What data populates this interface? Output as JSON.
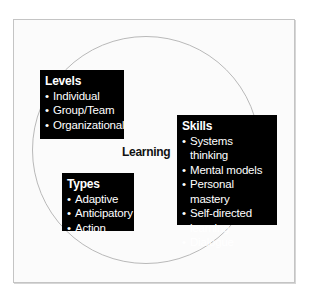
{
  "diagram": {
    "center_label": "Learning",
    "boxes": [
      {
        "title": "Levels",
        "items": [
          "Individual",
          "Group/Team",
          "Organizational"
        ]
      },
      {
        "title": "Skills",
        "items": [
          "Systems thinking",
          "Mental models",
          "Personal mastery",
          "Self-directed",
          "learning",
          "Dialogue"
        ]
      },
      {
        "title": "Types",
        "items": [
          "Adaptive",
          "Anticipatory",
          "Action"
        ]
      }
    ],
    "bullet": "•",
    "colors": {
      "box_background": "#000000",
      "box_text": "#ffffff",
      "circle_stroke": "#b9b9b9",
      "frame_border": "#c4c4c4"
    }
  }
}
